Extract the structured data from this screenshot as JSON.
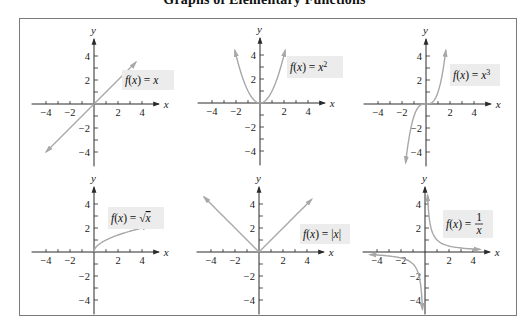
{
  "title": "Graphs of Elementary Functions",
  "style": {
    "frame_color": "#7a7a7a",
    "axis_color": "#2a2a2a",
    "curve_color": "#a8a8a8",
    "label_bg": "#ececec",
    "text_color": "#111111"
  },
  "chart_data": [
    {
      "type": "line",
      "title": "f(x) = x",
      "label_text": "f(x) = x",
      "xlabel": "x",
      "ylabel": "y",
      "xlim": [
        -5,
        5
      ],
      "ylim": [
        -5,
        5
      ],
      "x_ticks": [
        -4,
        -2,
        2,
        4
      ],
      "y_ticks": [
        4,
        2,
        -2,
        -4
      ],
      "minor_step": 1,
      "grid": false,
      "function": "x",
      "x": [
        -4,
        -3,
        -2,
        -1,
        0,
        1,
        2,
        3,
        3.5
      ],
      "y": [
        -4,
        -3,
        -2,
        -1,
        0,
        1,
        2,
        3,
        3.5
      ],
      "arrows": "both"
    },
    {
      "type": "line",
      "title": "f(x) = x^2",
      "label_text": "f(x) = x",
      "label_sup": "2",
      "xlabel": "x",
      "ylabel": "y",
      "xlim": [
        -5,
        5
      ],
      "ylim": [
        -5,
        5
      ],
      "x_ticks": [
        -4,
        -2,
        2,
        4
      ],
      "y_ticks": [
        4,
        2,
        -2,
        -4
      ],
      "minor_step": 1,
      "grid": false,
      "function": "x^2",
      "x": [
        -2.1,
        -1.5,
        -1,
        -0.5,
        0,
        0.5,
        1,
        1.5,
        2.1
      ],
      "y": [
        4.41,
        2.25,
        1,
        0.25,
        0,
        0.25,
        1,
        2.25,
        4.41
      ],
      "arrows": "both"
    },
    {
      "type": "line",
      "title": "f(x) = x^3",
      "label_text": "f(x) = x",
      "label_sup": "3",
      "xlabel": "x",
      "ylabel": "y",
      "xlim": [
        -5,
        5
      ],
      "ylim": [
        -5,
        5
      ],
      "x_ticks": [
        -4,
        -2,
        2,
        4
      ],
      "y_ticks": [
        4,
        2,
        -2,
        -4
      ],
      "minor_step": 1,
      "grid": false,
      "function": "x^3",
      "x": [
        -1.7,
        -1.5,
        -1,
        -0.5,
        0,
        0.5,
        1,
        1.5,
        1.65
      ],
      "y": [
        -4.91,
        -3.38,
        -1,
        -0.13,
        0,
        0.13,
        1,
        3.38,
        4.49
      ],
      "arrows": "both"
    },
    {
      "type": "line",
      "title": "f(x) = sqrt(x)",
      "label_text": "f(x) = ",
      "label_sqrt": "x",
      "xlabel": "x",
      "ylabel": "y",
      "xlim": [
        -5,
        5
      ],
      "ylim": [
        -5,
        5
      ],
      "x_ticks": [
        -4,
        -2,
        2,
        4
      ],
      "y_ticks": [
        4,
        2,
        -2,
        -4
      ],
      "minor_step": 1,
      "grid": false,
      "function": "sqrt(x)",
      "x": [
        0,
        0.25,
        0.5,
        1,
        2,
        3,
        4,
        4.6
      ],
      "y": [
        0,
        0.5,
        0.71,
        1,
        1.41,
        1.73,
        2,
        2.14
      ],
      "arrows": "end"
    },
    {
      "type": "line",
      "title": "f(x) = |x|",
      "label_text": "f(x) = |x|",
      "xlabel": "x",
      "ylabel": "y",
      "xlim": [
        -5,
        5
      ],
      "ylim": [
        -5,
        5
      ],
      "x_ticks": [
        -4,
        -2,
        2,
        4
      ],
      "y_ticks": [
        4,
        2,
        -2,
        -4
      ],
      "minor_step": 1,
      "grid": false,
      "function": "abs(x)",
      "x": [
        -4.6,
        -2,
        0,
        2,
        4.4
      ],
      "y": [
        4.6,
        2,
        0,
        2,
        4.4
      ],
      "arrows": "both"
    },
    {
      "type": "line",
      "title": "f(x) = 1/x",
      "label_text": "f(x) = ",
      "label_frac": [
        "1",
        "x"
      ],
      "xlabel": "x",
      "ylabel": "y",
      "xlim": [
        -5,
        5
      ],
      "ylim": [
        -5,
        5
      ],
      "x_ticks": [
        -4,
        -2,
        2,
        4
      ],
      "y_ticks": [
        4,
        2,
        -2,
        -4
      ],
      "minor_step": 1,
      "grid": false,
      "function": "1/x",
      "branches": [
        {
          "x": [
            -4.6,
            -3,
            -2,
            -1,
            -0.5,
            -0.3,
            -0.21
          ],
          "y": [
            -0.22,
            -0.33,
            -0.5,
            -1,
            -2,
            -3.33,
            -4.8
          ]
        },
        {
          "x": [
            0.21,
            0.3,
            0.5,
            1,
            2,
            3,
            4.6
          ],
          "y": [
            4.8,
            3.33,
            2,
            1,
            0.5,
            0.33,
            0.22
          ]
        }
      ],
      "arrows": "both"
    }
  ],
  "layout": {
    "panels": [
      {
        "ox": 94,
        "oy": 104,
        "label_x": 122,
        "label_y": 70,
        "label_w": 52,
        "label_h": 20
      },
      {
        "ox": 260,
        "oy": 103,
        "label_x": 287,
        "label_y": 56,
        "label_w": 56,
        "label_h": 22
      },
      {
        "ox": 426,
        "oy": 104,
        "label_x": 450,
        "label_y": 64,
        "label_w": 50,
        "label_h": 22
      },
      {
        "ox": 94,
        "oy": 252,
        "label_x": 108,
        "label_y": 207,
        "label_w": 56,
        "label_h": 22
      },
      {
        "ox": 259,
        "oy": 252,
        "label_x": 300,
        "label_y": 224,
        "label_w": 50,
        "label_h": 20
      },
      {
        "ox": 425,
        "oy": 252,
        "label_x": 443,
        "label_y": 210,
        "label_w": 50,
        "label_h": 28
      }
    ],
    "unit_px": 12
  }
}
